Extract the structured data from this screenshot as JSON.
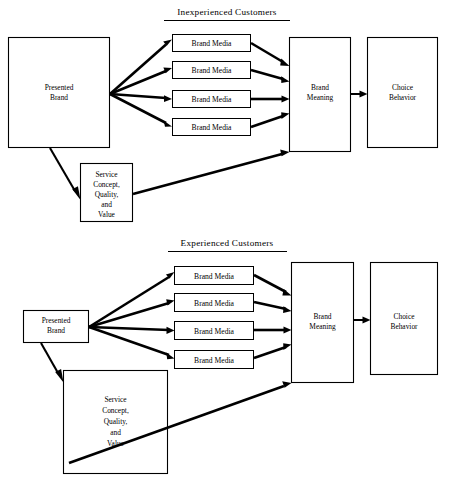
{
  "figure": {
    "background": "#ffffff",
    "ink": "#000000",
    "panels": [
      {
        "id": "inexperienced",
        "title": "Inexperienced Customers",
        "nodes": {
          "presented_brand": "Presented\nBrand",
          "presented_brand_lines": [
            "Presented",
            "Brand"
          ],
          "service_concept_lines": [
            "Service",
            "Concept,",
            "Quality,",
            "and",
            "Value"
          ],
          "brand_media": [
            "Brand Media",
            "Brand Media",
            "Brand Media",
            "Brand Media"
          ],
          "brand_meaning_lines": [
            "Brand",
            "Meaning"
          ],
          "choice_behavior_lines": [
            "Choice",
            "Behavior"
          ]
        }
      },
      {
        "id": "experienced",
        "title": "Experienced Customers",
        "nodes": {
          "presented_brand": "Presented\nBrand",
          "presented_brand_lines": [
            "Presented",
            "Brand"
          ],
          "service_concept_lines": [
            "Service",
            "Concept,",
            "Quality,",
            "and",
            "Value"
          ],
          "brand_media": [
            "Brand Media",
            "Brand Media",
            "Brand Media",
            "Brand Media"
          ],
          "brand_meaning_lines": [
            "Brand",
            "Meaning"
          ],
          "choice_behavior_lines": [
            "Choice",
            "Behavior"
          ]
        }
      }
    ]
  },
  "p1": {
    "title": "Inexperienced Customers",
    "pb1": "Presented",
    "pb2": "Brand",
    "sc1": "Service",
    "sc2": "Concept,",
    "sc3": "Quality,",
    "sc4": "and",
    "sc5": "Value",
    "bm1": "Brand Media",
    "bm2": "Brand Media",
    "bm3": "Brand Media",
    "bm4": "Brand Media",
    "bmean1": "Brand",
    "bmean2": "Meaning",
    "cb1": "Choice",
    "cb2": "Behavior"
  },
  "p2": {
    "title": "Experienced Customers",
    "pb1": "Presented",
    "pb2": "Brand",
    "sc1": "Service",
    "sc2": "Concept,",
    "sc3": "Quality,",
    "sc4": "and",
    "sc5": "Value",
    "bm1": "Brand Media",
    "bm2": "Brand Media",
    "bm3": "Brand Media",
    "bm4": "Brand Media",
    "bmean1": "Brand",
    "bmean2": "Meaning",
    "cb1": "Choice",
    "cb2": "Behavior"
  }
}
